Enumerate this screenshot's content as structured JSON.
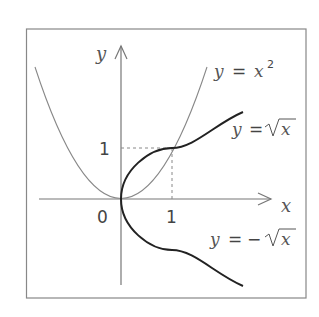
{
  "diagram": {
    "axes": {
      "x_label": "x",
      "y_label": "y",
      "origin_label": "0",
      "x_tick_label": "1",
      "y_tick_label": "1"
    },
    "curves": [
      {
        "name": "parabola",
        "label_lhs": "y",
        "label_eq": "=",
        "label_rhs": "x",
        "label_exp": "2",
        "style": "thin"
      },
      {
        "name": "sqrt-positive",
        "label_lhs": "y",
        "label_eq": "=",
        "label_rhs": "x",
        "label_sign": "",
        "style": "bold"
      },
      {
        "name": "sqrt-negative",
        "label_lhs": "y",
        "label_eq": "=",
        "label_rhs": "x",
        "label_sign": "−",
        "style": "bold"
      }
    ],
    "intersection": {
      "x": 1,
      "y": 1,
      "guides": "dashed"
    },
    "colors": {
      "frame": "#777777",
      "axes": "#777777",
      "thin_curve": "#888888",
      "bold_curve": "#222222",
      "text": "#555555"
    }
  }
}
